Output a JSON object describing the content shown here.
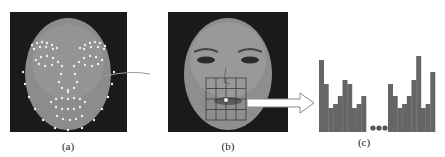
{
  "figure": {
    "panels": [
      {
        "id": "a",
        "caption": "(a)",
        "description": "Face with facial landmark points"
      },
      {
        "id": "b",
        "caption": "(b)",
        "description": "Face with 4x4 grid over mouth region"
      },
      {
        "id": "c",
        "caption": "(c)",
        "description": "Concatenated histogram features"
      }
    ],
    "colors": {
      "background": "#ffffff",
      "face_bg": "#1a1a1a",
      "face": "#8a8a8a",
      "landmark": "#e8e8e8",
      "histogram": "#666666",
      "connector": "#9a9a9a"
    }
  },
  "chart_data": {
    "type": "bar",
    "title": "",
    "xlabel": "",
    "ylabel": "",
    "groups": [
      {
        "name": "left-histogram",
        "values": [
          9,
          6,
          3,
          3.5,
          4.5,
          6.5,
          6,
          3,
          3.5,
          4.5
        ]
      },
      {
        "name": "right-histogram",
        "values": [
          6,
          4.5,
          3,
          3.5,
          4.5,
          6.5,
          9.5,
          3,
          3.5,
          7.5
        ]
      }
    ],
    "separator": "...",
    "caption": "(c)"
  }
}
